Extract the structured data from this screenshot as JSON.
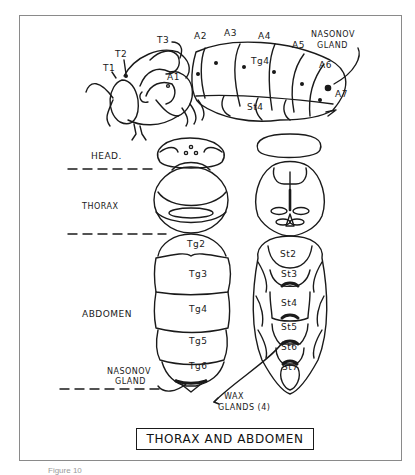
{
  "figure": {
    "title": "THORAX AND ABDOMEN",
    "caption": "Figure 10"
  },
  "lateral_view": {
    "thorax_labels": [
      "T1",
      "T2",
      "T3"
    ],
    "abdomen_labels": [
      "A1",
      "A2",
      "A3",
      "A4",
      "A5",
      "A6",
      "A7"
    ],
    "tergite_label": "Tg4",
    "sternite_label": "St4",
    "gland_label_line1": "NASONOV",
    "gland_label_line2": "GLAND"
  },
  "body_regions": {
    "head": "HEAD.",
    "thorax": "THORAX",
    "abdomen": "ABDOMEN"
  },
  "dorsal_view": {
    "tergites": [
      "Tg2",
      "Tg3",
      "Tg4",
      "Tg5",
      "Tg6"
    ],
    "gland_label_line1": "NASONOV",
    "gland_label_line2": "GLAND"
  },
  "ventral_view": {
    "sternites": [
      "St2",
      "St3",
      "St4",
      "St5",
      "St6",
      "St7"
    ],
    "wax_label_line1": "WAX",
    "wax_label_line2": "GLANDS (4)"
  },
  "colors": {
    "ink": "#1a1a1a",
    "frame": "#8a8a8a",
    "background": "#ffffff"
  }
}
